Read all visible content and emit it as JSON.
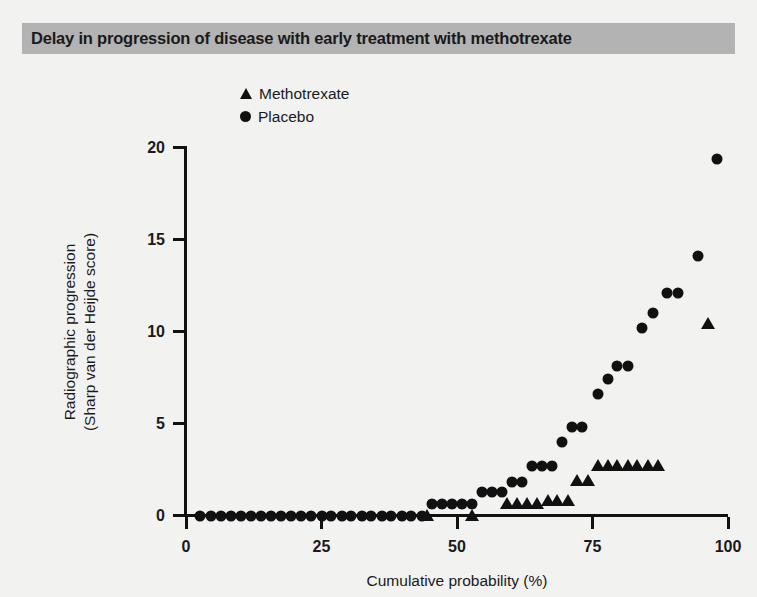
{
  "figure": {
    "title": "Delay in progression of disease with early treatment with methotrexate",
    "title_bar_color": "#b3b3b3",
    "background_color": "#f2f2f1",
    "marker_color": "#111111"
  },
  "legend": {
    "position": "top-center",
    "entries": [
      {
        "label": "Methotrexate",
        "marker": "triangle-up-icon"
      },
      {
        "label": "Placebo",
        "marker": "circle-icon"
      }
    ]
  },
  "chart_data": {
    "type": "scatter",
    "title": "Delay in progression of disease with early treatment with methotrexate",
    "xlabel": "Cumulative probability (%)",
    "ylabel": "Radiographic progression\n(Sharp van der Heijde score)",
    "ylabel_line1": "Radiographic progression",
    "ylabel_line2": "(Sharp van der Heijde score)",
    "xlim": [
      0,
      100
    ],
    "ylim": [
      0,
      20
    ],
    "xticks": [
      0,
      25,
      50,
      75,
      100
    ],
    "yticks": [
      0,
      5,
      10,
      15,
      20
    ],
    "xticklabels": [
      "0",
      "25",
      "50",
      "75",
      "100"
    ],
    "yticklabels": [
      "0",
      "5",
      "10",
      "15",
      "20"
    ],
    "grid": false,
    "series": [
      {
        "name": "Placebo",
        "marker": "circle",
        "color": "#111111",
        "points": [
          [
            2.6,
            0.0
          ],
          [
            4.6,
            0.0
          ],
          [
            6.4,
            0.0
          ],
          [
            8.3,
            0.0
          ],
          [
            10.1,
            0.0
          ],
          [
            12.0,
            0.0
          ],
          [
            13.9,
            0.0
          ],
          [
            15.7,
            0.0
          ],
          [
            17.6,
            0.0
          ],
          [
            19.4,
            0.0
          ],
          [
            21.3,
            0.0
          ],
          [
            23.1,
            0.0
          ],
          [
            25.0,
            0.0
          ],
          [
            26.8,
            0.0
          ],
          [
            28.7,
            0.0
          ],
          [
            30.5,
            0.0
          ],
          [
            32.4,
            0.0
          ],
          [
            34.2,
            0.0
          ],
          [
            36.1,
            0.0
          ],
          [
            37.9,
            0.0
          ],
          [
            39.8,
            0.0
          ],
          [
            41.6,
            0.0
          ],
          [
            43.5,
            0.0
          ],
          [
            45.3,
            0.6
          ],
          [
            47.2,
            0.6
          ],
          [
            49.0,
            0.6
          ],
          [
            50.9,
            0.6
          ],
          [
            52.7,
            0.6
          ],
          [
            54.6,
            1.3
          ],
          [
            56.4,
            1.3
          ],
          [
            58.3,
            1.3
          ],
          [
            60.1,
            1.8
          ],
          [
            62.0,
            1.8
          ],
          [
            63.8,
            2.7
          ],
          [
            65.7,
            2.7
          ],
          [
            67.5,
            2.7
          ],
          [
            69.4,
            4.0
          ],
          [
            71.2,
            4.8
          ],
          [
            73.1,
            4.8
          ],
          [
            76.0,
            6.6
          ],
          [
            77.8,
            7.4
          ],
          [
            79.6,
            8.1
          ],
          [
            81.5,
            8.1
          ],
          [
            84.2,
            10.2
          ],
          [
            86.1,
            11.0
          ],
          [
            88.8,
            12.1
          ],
          [
            90.7,
            12.1
          ],
          [
            94.4,
            14.1
          ],
          [
            97.9,
            19.4
          ]
        ]
      },
      {
        "name": "Methotrexate",
        "marker": "triangle",
        "color": "#111111",
        "points": [
          [
            44.4,
            0.0
          ],
          [
            52.7,
            0.0
          ],
          [
            59.2,
            0.6
          ],
          [
            61.1,
            0.6
          ],
          [
            63.0,
            0.6
          ],
          [
            64.8,
            0.6
          ],
          [
            66.7,
            0.8
          ],
          [
            68.5,
            0.8
          ],
          [
            70.4,
            0.8
          ],
          [
            72.2,
            1.9
          ],
          [
            74.1,
            1.9
          ],
          [
            76.0,
            2.7
          ],
          [
            77.8,
            2.7
          ],
          [
            79.6,
            2.7
          ],
          [
            81.5,
            2.7
          ],
          [
            83.3,
            2.7
          ],
          [
            85.2,
            2.7
          ],
          [
            87.0,
            2.7
          ],
          [
            96.3,
            10.4
          ]
        ]
      }
    ]
  }
}
